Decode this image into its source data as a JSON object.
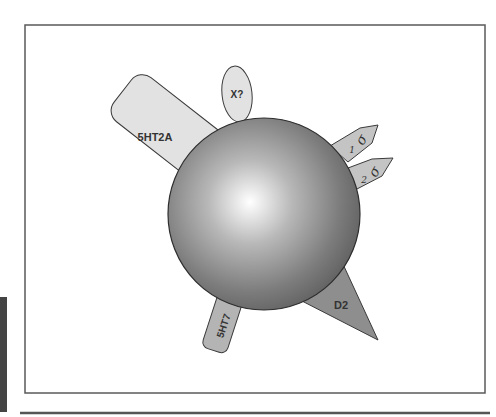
{
  "figure": {
    "title": "",
    "colors": {
      "frame": "#5a5a5a",
      "rule": "#555555",
      "side_bar": "#444444",
      "receptor_light": "#e2e2e2",
      "receptor_mid": "#c4c4c4",
      "receptor_dark": "#8e8e8e",
      "outline": "#3a3a3a",
      "sphere_center": "#ffffff",
      "sphere_edge": "#5e5e5e"
    },
    "cell": {
      "label": "",
      "shape": "sphere"
    },
    "receptors": [
      {
        "id": "5ht2a",
        "label": "5HT2A",
        "shape": "rounded-rectangle"
      },
      {
        "id": "x",
        "label": "X?",
        "shape": "ellipse"
      },
      {
        "id": "sigma1",
        "label": "σ",
        "subscript": "1",
        "shape": "pentagon-arrow"
      },
      {
        "id": "sigma2",
        "label": "σ",
        "subscript": "2",
        "shape": "pentagon-arrow"
      },
      {
        "id": "d2",
        "label": "D2",
        "shape": "triangle"
      },
      {
        "id": "5ht7",
        "label": "5HT7",
        "shape": "rounded-rectangle"
      }
    ]
  }
}
